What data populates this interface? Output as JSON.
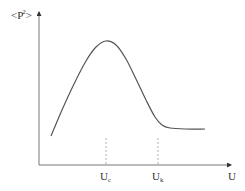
{
  "chart_data": {
    "type": "line",
    "title": "",
    "xlabel": "U",
    "ylabel": "<P^2>",
    "ylabel_parts": {
      "open": "<",
      "base": "P",
      "sup": "2",
      "close": ">"
    },
    "ticks": [
      {
        "base": "U",
        "sub": "c",
        "x_pos": 106
      },
      {
        "base": "U",
        "sub": "k",
        "x_pos": 158
      }
    ],
    "grid": false,
    "legend": null,
    "series": [
      {
        "name": "<P^2>(U)",
        "description": "Rises from low value, peaks at U_c, drops and plateaus beyond U_k",
        "points_px": [
          [
            51,
            136
          ],
          [
            62,
            110
          ],
          [
            74,
            84
          ],
          [
            86,
            61
          ],
          [
            96,
            47
          ],
          [
            106,
            41
          ],
          [
            116,
            45
          ],
          [
            126,
            59
          ],
          [
            136,
            79
          ],
          [
            146,
            100
          ],
          [
            155,
            117
          ],
          [
            162,
            125
          ],
          [
            170,
            128
          ],
          [
            185,
            129
          ],
          [
            205,
            129
          ]
        ]
      }
    ],
    "colors": {
      "curve": "#555555",
      "axis": "#777777",
      "dashed": "#999999",
      "text": "#333333"
    }
  }
}
